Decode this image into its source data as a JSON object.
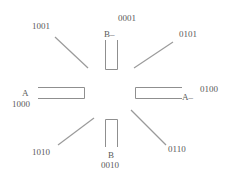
{
  "diagram": {
    "type": "eight-direction binary code diagram",
    "line_color": "#9a9a9a",
    "text_color": "#5a5a5a",
    "segments": {
      "top": {
        "letter": "B–",
        "code": "0001"
      },
      "bottom": {
        "letter": "B",
        "code": "0010"
      },
      "left": {
        "letter": "A",
        "code": "1000"
      },
      "right": {
        "letter": "A–",
        "code": "0100"
      }
    },
    "diagonals": {
      "top_left": {
        "code": "1001"
      },
      "top_right": {
        "code": "0101"
      },
      "bottom_left": {
        "code": "1010"
      },
      "bottom_right": {
        "code": "0110"
      }
    }
  }
}
